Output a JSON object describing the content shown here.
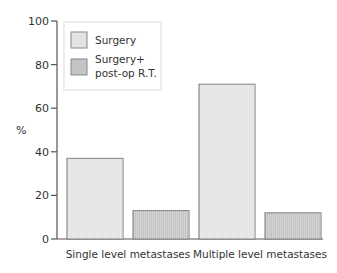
{
  "chart_data": {
    "type": "bar",
    "title": "",
    "xlabel": "",
    "ylabel": "%",
    "ylim": [
      0,
      100
    ],
    "yticks": [
      0,
      20,
      40,
      60,
      80,
      100
    ],
    "categories": [
      "Single level metastases",
      "Multiple level metastases"
    ],
    "series": [
      {
        "name": "Surgery",
        "color": "#e3e3e3",
        "values": [
          37,
          71
        ]
      },
      {
        "name": "Surgery+ post-op R.T.",
        "color": "#c4c4c4",
        "values": [
          13,
          12
        ]
      }
    ],
    "legend": {
      "position": "top-left",
      "entries": [
        {
          "lines": [
            "Surgery"
          ],
          "color": "#e3e3e3"
        },
        {
          "lines": [
            "Surgery+",
            "post-op R.T."
          ],
          "color": "#c4c4c4"
        }
      ]
    },
    "grid": false
  }
}
